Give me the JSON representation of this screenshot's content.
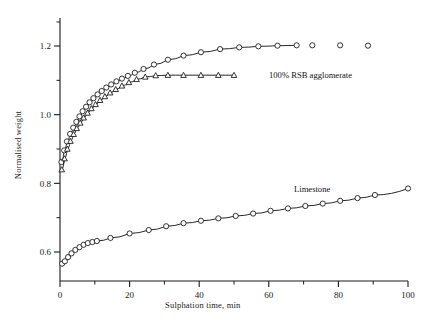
{
  "chart_data": {
    "type": "scatter",
    "title": "",
    "xlabel": "Sulphation time, min",
    "ylabel": "Normalised weight",
    "xlim": [
      -2,
      104
    ],
    "ylim": [
      0.53,
      1.285
    ],
    "xticks": [
      0,
      20,
      40,
      60,
      80,
      100
    ],
    "xticklabels": [
      "0",
      "20",
      "40",
      "60",
      "80",
      "100"
    ],
    "xminorticks": [
      10,
      30,
      50,
      70,
      90
    ],
    "yticks": [
      0.6,
      0.8,
      1.0,
      1.2
    ],
    "yticklabels": [
      "0.6",
      "0.8",
      "1.0",
      "1.2"
    ],
    "yminorticks": [
      0.7,
      0.9,
      1.1,
      1.27
    ],
    "grid": false,
    "legend_position": "inline-annotations",
    "annotations": [
      {
        "text": "100% RSB agglomerate",
        "x": 60.5,
        "y": 1.112
      },
      {
        "text": "Limestone",
        "x": 67.5,
        "y": 0.778
      }
    ],
    "series": [
      {
        "name": "100% RSB agglomerate (circles)",
        "marker": "circle",
        "marker_size": 5.2,
        "line": true,
        "line_end_x": 72,
        "color": "#111111",
        "points": [
          {
            "x": 0.4,
            "y": 0.862
          },
          {
            "x": 1.2,
            "y": 0.896
          },
          {
            "x": 2.0,
            "y": 0.922
          },
          {
            "x": 2.9,
            "y": 0.944
          },
          {
            "x": 3.8,
            "y": 0.962
          },
          {
            "x": 4.7,
            "y": 0.979
          },
          {
            "x": 5.6,
            "y": 0.995
          },
          {
            "x": 6.5,
            "y": 1.01
          },
          {
            "x": 7.5,
            "y": 1.023
          },
          {
            "x": 8.5,
            "y": 1.036
          },
          {
            "x": 9.6,
            "y": 1.048
          },
          {
            "x": 10.8,
            "y": 1.059
          },
          {
            "x": 12.0,
            "y": 1.069
          },
          {
            "x": 13.3,
            "y": 1.079
          },
          {
            "x": 14.7,
            "y": 1.088
          },
          {
            "x": 16.2,
            "y": 1.097
          },
          {
            "x": 17.8,
            "y": 1.105
          },
          {
            "x": 19.5,
            "y": 1.113
          },
          {
            "x": 21.5,
            "y": 1.122
          },
          {
            "x": 24.0,
            "y": 1.133
          },
          {
            "x": 27.0,
            "y": 1.146
          },
          {
            "x": 31.0,
            "y": 1.16
          },
          {
            "x": 35.5,
            "y": 1.172
          },
          {
            "x": 40.5,
            "y": 1.182
          },
          {
            "x": 46.0,
            "y": 1.191
          },
          {
            "x": 51.5,
            "y": 1.196
          },
          {
            "x": 57.0,
            "y": 1.199
          },
          {
            "x": 62.5,
            "y": 1.201
          },
          {
            "x": 68.0,
            "y": 1.202
          },
          {
            "x": 72.5,
            "y": 1.202
          },
          {
            "x": 80.5,
            "y": 1.202
          },
          {
            "x": 88.5,
            "y": 1.201
          }
        ]
      },
      {
        "name": "agglomerate (triangles)",
        "marker": "triangle",
        "marker_size": 5.0,
        "line": true,
        "line_end_x": 51.5,
        "color": "#111111",
        "points": [
          {
            "x": 0.5,
            "y": 0.84
          },
          {
            "x": 1.3,
            "y": 0.872
          },
          {
            "x": 2.1,
            "y": 0.9
          },
          {
            "x": 3.0,
            "y": 0.923
          },
          {
            "x": 3.9,
            "y": 0.943
          },
          {
            "x": 4.8,
            "y": 0.96
          },
          {
            "x": 5.8,
            "y": 0.976
          },
          {
            "x": 6.8,
            "y": 0.991
          },
          {
            "x": 7.9,
            "y": 1.005
          },
          {
            "x": 9.0,
            "y": 1.018
          },
          {
            "x": 10.2,
            "y": 1.03
          },
          {
            "x": 11.5,
            "y": 1.042
          },
          {
            "x": 12.9,
            "y": 1.053
          },
          {
            "x": 14.4,
            "y": 1.064
          },
          {
            "x": 16.0,
            "y": 1.074
          },
          {
            "x": 17.8,
            "y": 1.084
          },
          {
            "x": 19.8,
            "y": 1.094
          },
          {
            "x": 22.0,
            "y": 1.103
          },
          {
            "x": 24.5,
            "y": 1.11
          },
          {
            "x": 27.5,
            "y": 1.114
          },
          {
            "x": 31.0,
            "y": 1.115
          },
          {
            "x": 35.5,
            "y": 1.115
          },
          {
            "x": 40.5,
            "y": 1.115
          },
          {
            "x": 45.5,
            "y": 1.115
          },
          {
            "x": 50.0,
            "y": 1.115
          }
        ]
      },
      {
        "name": "Limestone",
        "marker": "circle",
        "marker_size": 5.2,
        "line": true,
        "line_end_x": 100,
        "color": "#111111",
        "points": [
          {
            "x": 0.6,
            "y": 0.566
          },
          {
            "x": 1.4,
            "y": 0.573
          },
          {
            "x": 2.3,
            "y": 0.585
          },
          {
            "x": 3.3,
            "y": 0.596
          },
          {
            "x": 4.4,
            "y": 0.606
          },
          {
            "x": 5.6,
            "y": 0.614
          },
          {
            "x": 6.8,
            "y": 0.621
          },
          {
            "x": 8.0,
            "y": 0.626
          },
          {
            "x": 9.3,
            "y": 0.629
          },
          {
            "x": 10.6,
            "y": 0.632
          },
          {
            "x": 14.5,
            "y": 0.641
          },
          {
            "x": 20.0,
            "y": 0.654
          },
          {
            "x": 25.5,
            "y": 0.664
          },
          {
            "x": 30.5,
            "y": 0.675
          },
          {
            "x": 35.5,
            "y": 0.684
          },
          {
            "x": 40.5,
            "y": 0.691
          },
          {
            "x": 45.5,
            "y": 0.698
          },
          {
            "x": 50.5,
            "y": 0.705
          },
          {
            "x": 55.5,
            "y": 0.712
          },
          {
            "x": 60.5,
            "y": 0.72
          },
          {
            "x": 65.5,
            "y": 0.727
          },
          {
            "x": 70.5,
            "y": 0.734
          },
          {
            "x": 75.5,
            "y": 0.741
          },
          {
            "x": 80.5,
            "y": 0.749
          },
          {
            "x": 85.5,
            "y": 0.757
          },
          {
            "x": 90.5,
            "y": 0.766
          },
          {
            "x": 100.0,
            "y": 0.785
          }
        ]
      }
    ]
  }
}
